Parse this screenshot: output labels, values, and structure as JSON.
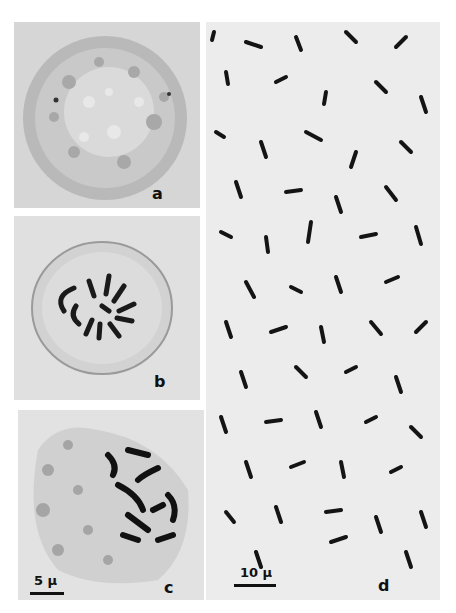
{
  "figure": {
    "panels": [
      {
        "id": "a",
        "label": "a",
        "description": "Spherical cell, granular cytoplasm (phase contrast)"
      },
      {
        "id": "b",
        "label": "b",
        "description": "Cell with condensed chromosomes in ring arrangement"
      },
      {
        "id": "c",
        "label": "c",
        "description": "Cell with condensed chromosomes, irregular cytoplasm"
      },
      {
        "id": "d",
        "label": "d",
        "description": "Field of many scattered dark rod-shaped chromosomes"
      }
    ],
    "scale_bars": [
      {
        "panel": "c",
        "text": "5 μ"
      },
      {
        "panel": "d",
        "text": "10 μ"
      }
    ]
  }
}
